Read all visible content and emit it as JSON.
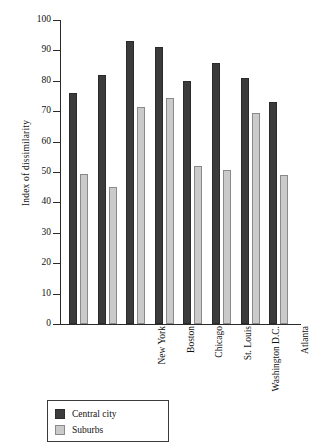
{
  "chart_data": {
    "type": "bar",
    "title": "",
    "xlabel": "",
    "ylabel": "Index of dissimilarity",
    "ylim": [
      0,
      100
    ],
    "ytick_step": 10,
    "yticks": [
      100,
      90,
      80,
      70,
      60,
      50,
      40,
      30,
      20,
      10,
      0
    ],
    "grid": false,
    "legend_position": "bottom-left",
    "categories": [
      "New York",
      "Boston",
      "Chicago",
      "St. Louis",
      "Washington D.C.",
      "Atlanta",
      "Los Angeles",
      "Denver"
    ],
    "series": [
      {
        "name": "Central city",
        "color": "#3b3b3b",
        "values": [
          76,
          82,
          93,
          91,
          80,
          86,
          81,
          73
        ]
      },
      {
        "name": "Suburbs",
        "color": "#cacaca",
        "values": [
          49.5,
          45,
          71.5,
          74.5,
          52,
          50.5,
          69.5,
          49
        ]
      }
    ]
  },
  "legend": {
    "items": [
      {
        "label": "Central city",
        "swatch": "central"
      },
      {
        "label": "Suburbs",
        "swatch": "suburb"
      }
    ]
  }
}
